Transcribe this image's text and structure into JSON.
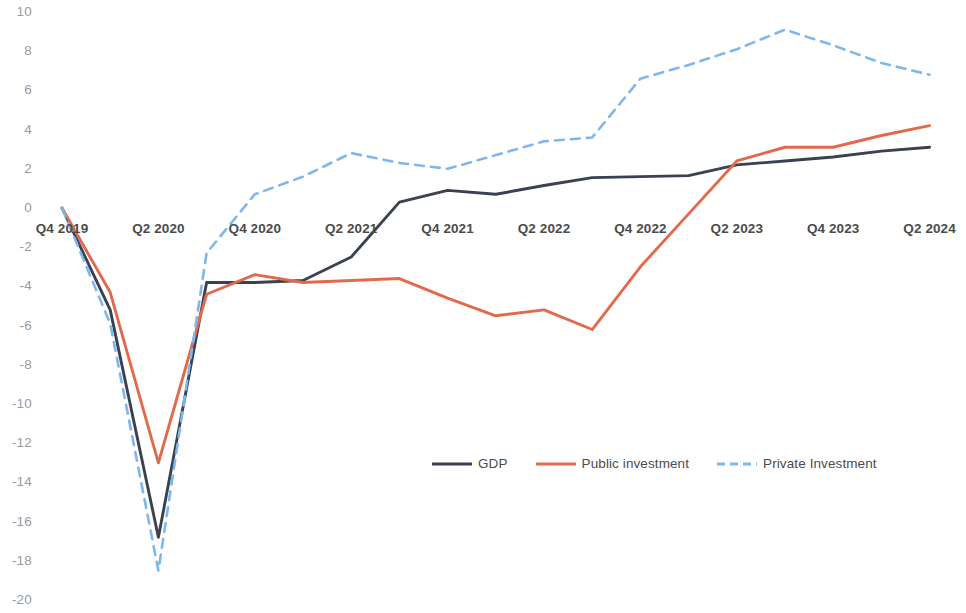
{
  "chart_data": {
    "type": "line",
    "title": "",
    "subtitle": "",
    "xlabel": "",
    "ylabel": "",
    "ylim": [
      -20,
      10
    ],
    "ytick_step": 2,
    "yticks": [
      "10",
      "8",
      "6",
      "4",
      "2",
      "0",
      "-2",
      "-4",
      "-6",
      "-8",
      "-10",
      "-12",
      "-14",
      "-16",
      "-18",
      "-20"
    ],
    "grid": false,
    "legend_position": "bottom-center",
    "x": [
      "Q4 2019",
      "Q1 2020",
      "Q2 2020",
      "Q3 2020",
      "Q4 2020",
      "Q1 2021",
      "Q2 2021",
      "Q3 2021",
      "Q4 2021",
      "Q1 2022",
      "Q2 2022",
      "Q3 2022",
      "Q4 2022",
      "Q1 2023",
      "Q2 2023",
      "Q3 2023",
      "Q4 2023",
      "Q1 2024",
      "Q2 2024"
    ],
    "xtick_labels": [
      "Q4 2019",
      "Q2 2020",
      "Q4 2020",
      "Q2 2021",
      "Q4 2021",
      "Q2 2022",
      "Q4 2022",
      "Q2 2023",
      "Q4 2023",
      "Q2 2024"
    ],
    "series": [
      {
        "name": "GDP",
        "color": "#3a4250",
        "style": "solid",
        "values": [
          0,
          -5.2,
          -16.8,
          -3.8,
          -3.8,
          -3.7,
          -2.5,
          0.3,
          0.9,
          0.7,
          1.15,
          1.55,
          1.6,
          1.65,
          2.2,
          2.4,
          2.6,
          2.9,
          3.1
        ]
      },
      {
        "name": "Public investment",
        "color": "#e2694b",
        "style": "solid",
        "values": [
          0,
          -4.3,
          -13.0,
          -4.4,
          -3.4,
          -3.8,
          -3.7,
          -3.6,
          -4.6,
          -5.5,
          -5.2,
          -6.2,
          -3.0,
          -0.3,
          2.4,
          3.1,
          3.1,
          3.7,
          4.2
        ]
      },
      {
        "name": "Private Investment",
        "color": "#7eb6ee",
        "style": "dashed",
        "values": [
          0,
          -5.9,
          -18.5,
          -2.3,
          0.7,
          1.6,
          2.8,
          2.3,
          2.0,
          2.7,
          3.4,
          3.6,
          6.6,
          7.3,
          8.1,
          9.1,
          8.3,
          7.4,
          6.8
        ]
      }
    ]
  },
  "legend": {
    "items": [
      {
        "label": "GDP",
        "icon": "solid-line-swatch"
      },
      {
        "label": "Public investment",
        "icon": "solid-line-swatch"
      },
      {
        "label": "Private Investment",
        "icon": "dashed-line-swatch"
      }
    ]
  }
}
